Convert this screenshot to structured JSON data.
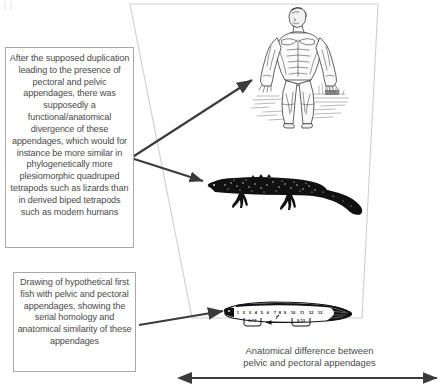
{
  "figure": {
    "title_artifact": "(a)",
    "background_color": "#ffffff",
    "line_color": "#3b3b3b",
    "funnel_border_color": "#cfcfcf",
    "box_border_color": "#a8a8a8",
    "text_color": "#4a4a4a"
  },
  "captions": {
    "upper": "After the supposed duplication leading to the presence of pectoral and pelvic appendages, there was supposedly a functional/anatomical divergence of these appendages, which would for instance be more similar in phylogenetically more plesiomorphic quadruped tetrapods such as lizards than in derived biped tetrapods such as modern humans",
    "lower": "Drawing of hypothetical first fish with pelvic and pectoral appendages, showing the serial homology and anatomical similarity of these appendages"
  },
  "axis": {
    "label_line1": "Anatomical difference between",
    "label_line2": "pelvic and pectoral appendages",
    "arrow_type": "double-headed-horizontal"
  },
  "organisms": [
    {
      "id": "human",
      "name": "human-anatomical-figure",
      "description": "Anatomical (ecorche) drawing of a standing modern human, biped tetrapod",
      "icon": "human-figure-icon"
    },
    {
      "id": "lizard",
      "name": "lizard-silhouette",
      "description": "Black silhouette of a lizard, plesiomorphic quadruped tetrapod",
      "icon": "lizard-silhouette-icon"
    },
    {
      "id": "fish",
      "name": "hypothetical-first-fish-diagram",
      "description": "Drawing of hypothetical first fish with pelvic and pectoral appendages showing serial homology",
      "icon": "fish-diagram-icon"
    }
  ],
  "fish_diagram": {
    "segment_numbers": [
      "1",
      "2",
      "3",
      "4",
      "5",
      "6",
      "7",
      "8",
      "9",
      "10",
      "11",
      "12",
      "13"
    ],
    "bracket_labels": [
      "9-13",
      "9-13"
    ],
    "inner_arrow": "leftward-arrow"
  },
  "arrows": [
    {
      "name": "arrow-to-human",
      "from": "caption-upper",
      "to": "human"
    },
    {
      "name": "arrow-to-lizard",
      "from": "caption-upper",
      "to": "lizard"
    },
    {
      "name": "arrow-to-fish",
      "from": "caption-lower",
      "to": "fish"
    }
  ]
}
